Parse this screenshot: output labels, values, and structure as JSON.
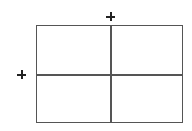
{
  "diagram": {
    "type": "2x2 grid",
    "rows": 2,
    "columns": 2,
    "line_color": "#555555",
    "marker_color": "#222222",
    "markers": [
      {
        "name": "add-column-marker",
        "icon": "plus-icon",
        "position": "above vertical divider"
      },
      {
        "name": "add-row-marker",
        "icon": "plus-icon",
        "position": "left of horizontal divider"
      }
    ],
    "cells": [
      {
        "row": 1,
        "col": 1,
        "text": ""
      },
      {
        "row": 1,
        "col": 2,
        "text": ""
      },
      {
        "row": 2,
        "col": 1,
        "text": ""
      },
      {
        "row": 2,
        "col": 2,
        "text": ""
      }
    ]
  }
}
